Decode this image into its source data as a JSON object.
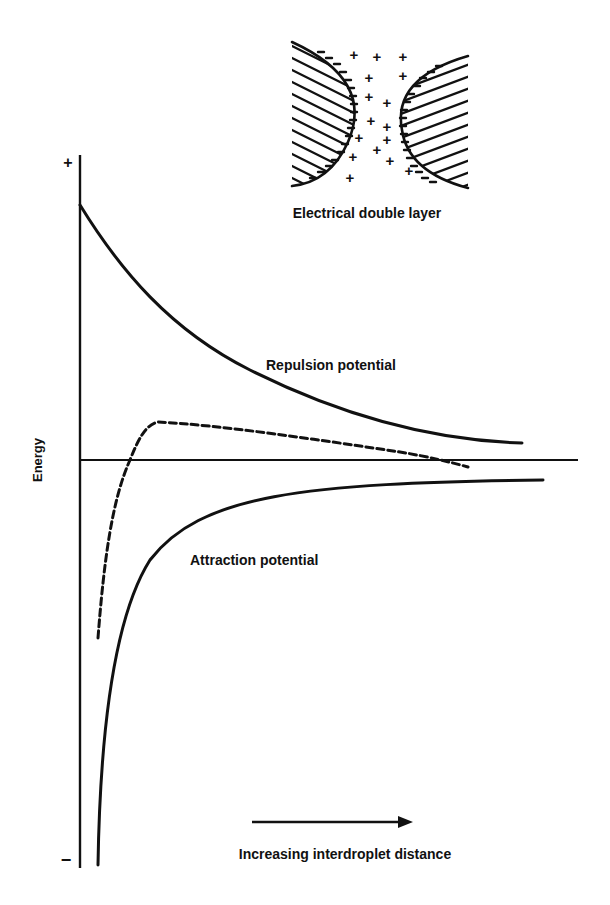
{
  "figure": {
    "type": "DLVO energy diagram",
    "y_axis": {
      "label": "Energy",
      "plus_sign": "+",
      "minus_sign": "−"
    },
    "x_axis": {
      "caption": "Increasing interdroplet distance"
    },
    "curves": [
      {
        "name": "Repulsion potential",
        "style": "solid",
        "label": "Repulsion potential"
      },
      {
        "name": "Attraction potential",
        "style": "solid",
        "label": "Attraction potential"
      },
      {
        "name": "Net potential",
        "style": "dashed",
        "label": ""
      }
    ],
    "inset": {
      "caption": "Electrical double layer",
      "plus_sign": "+",
      "minus_mark": "-"
    }
  },
  "colors": {
    "ink": "#111111",
    "background": "#ffffff"
  }
}
